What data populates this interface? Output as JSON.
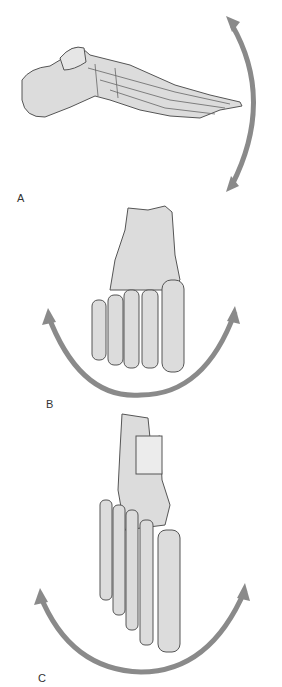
{
  "figure": {
    "panels": [
      {
        "label": "A",
        "view": "lateral view of foot, arrow indicating dorsiflexion/plantarflexion"
      },
      {
        "label": "B",
        "view": "anterior/distal view of foot, arrow indicating inversion/eversion"
      },
      {
        "label": "C",
        "view": "dorsal view of foot, arrow indicating abduction/adduction"
      }
    ],
    "colors": {
      "arrow": "#8a8a8a",
      "bone_fill": "#dcdcdc",
      "bone_shade": "#b8b8b8",
      "bone_outline": "#555555",
      "background": "#ffffff"
    }
  }
}
